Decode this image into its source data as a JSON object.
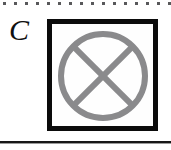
{
  "figure": {
    "panel_label": "C",
    "label_style": "italic-serif",
    "background_color": "#ffffff"
  },
  "top_rule": {
    "name": "dotted-separator",
    "style": "dotted",
    "dot_color": "#59595b",
    "dot_size_px": 3,
    "dot_spacing_px": 11,
    "dot_count": 16,
    "start_x_px": 3,
    "y_px": 2
  },
  "bottom_rule": {
    "name": "solid-separator",
    "style": "solid",
    "color": "#171717",
    "shadow_color": "#9a9a9a",
    "thickness_px": 2,
    "y_px": 141
  },
  "symbol_box": {
    "name": "bounding-square",
    "border_color": "#0b0b0b",
    "border_width_px": 5,
    "fill_color": "#fefefe",
    "x_px": 47,
    "y_px": 19,
    "width_px": 111,
    "height_px": 112
  },
  "symbol": {
    "name": "circle-with-x",
    "description": "Circle crossed by an X (saltire) — crossed-circle glyph",
    "stroke_color": "#8a8a8c",
    "stroke_width_px": 6,
    "center_x_px": 51,
    "center_y_px": 52,
    "radius_px": 42,
    "x_arm_extent_px": 29.7
  }
}
